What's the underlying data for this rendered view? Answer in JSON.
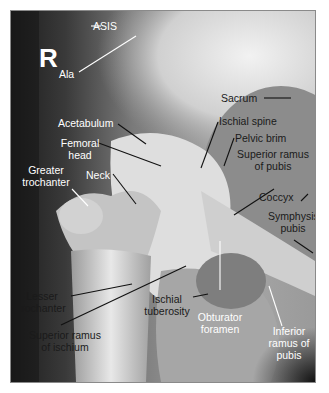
{
  "figure": {
    "type": "annotated-radiograph",
    "side_marker": "R",
    "labels": {
      "asis": "ASIS",
      "ala": "Ala",
      "acetabulum": "Acetabulum",
      "femoral_head": [
        "Femoral",
        "head"
      ],
      "greater_trochanter": [
        "Greater",
        "trochanter"
      ],
      "neck": "Neck",
      "sacrum": "Sacrum",
      "ischial_spine": "Ischial spine",
      "pelvic_brim": "Pelvic brim",
      "superior_ramus_pubis": [
        "Superior ramus",
        "of pubis"
      ],
      "coccyx": "Coccyx",
      "symphysis_pubis": [
        "Symphysis",
        "pubis"
      ],
      "lesser_trochanter": [
        "Lesser",
        "trochanter"
      ],
      "ischial_tuberosity": [
        "Ischial",
        "tuberosity"
      ],
      "superior_ramus_ischium": [
        "Superior ramus",
        "of ischium"
      ],
      "obturator_foramen": [
        "Obturator",
        "foramen"
      ],
      "inferior_ramus_pubis": [
        "Inferior",
        "ramus of",
        "pubis"
      ]
    },
    "colors": {
      "background": "#ffffff",
      "frame_border": "#8a8a8a",
      "dark_soft_tissue": "#2a2a2a",
      "bone": "#d8d8d8",
      "label_light": "#ffffff",
      "label_dark": "#1a1a1a"
    }
  }
}
